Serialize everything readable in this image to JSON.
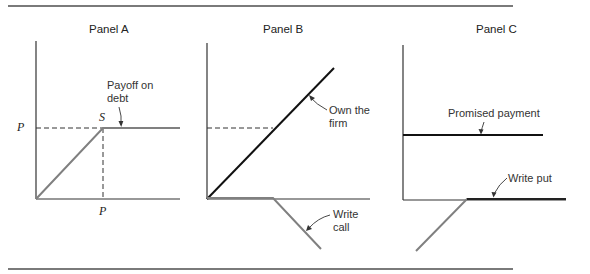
{
  "figure": {
    "caption_visible": "",
    "panels": [
      {
        "id": "A",
        "title": "Panel A",
        "axis_labels": {
          "y_tick": "P",
          "x_tick": "P",
          "kink_point": "S"
        },
        "annotations": [
          {
            "text_line1": "Payoff on",
            "text_line2": "debt"
          }
        ]
      },
      {
        "id": "B",
        "title": "Panel B",
        "annotations": [
          {
            "text_line1": "Own the",
            "text_line2": "firm"
          },
          {
            "text_line1": "Write",
            "text_line2": "call"
          }
        ]
      },
      {
        "id": "C",
        "title": "Panel C",
        "annotations": [
          {
            "text": "Promised payment"
          },
          {
            "text": "Write put"
          }
        ]
      }
    ],
    "colors": {
      "axis": "#333333",
      "payoff_gray": "#808080",
      "payoff_black": "#111111",
      "rule": "#7a7a7a"
    }
  }
}
